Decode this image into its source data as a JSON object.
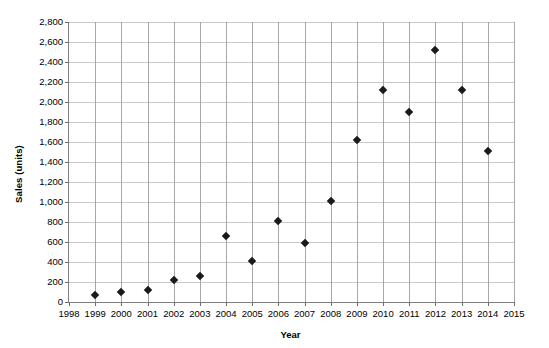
{
  "chart_data": {
    "type": "scatter",
    "title": "",
    "xlabel": "Year",
    "ylabel": "Sales (units)",
    "xlim": [
      1998,
      2015
    ],
    "ylim": [
      0,
      2800
    ],
    "ytick_step": 200,
    "xtick_step": 1,
    "grid": true,
    "legend": "none",
    "marker": "diamond",
    "marker_color": "#1a1a1a",
    "x": [
      1999,
      2000,
      2001,
      2002,
      2003,
      2004,
      2005,
      2006,
      2007,
      2008,
      2009,
      2010,
      2011,
      2012,
      2013,
      2014
    ],
    "values": [
      70,
      100,
      120,
      220,
      260,
      660,
      415,
      810,
      595,
      1010,
      1620,
      2120,
      1900,
      2520,
      2120,
      1510
    ],
    "points": [
      {
        "year": 1999,
        "sales": 70
      },
      {
        "year": 2000,
        "sales": 100
      },
      {
        "year": 2001,
        "sales": 120
      },
      {
        "year": 2002,
        "sales": 220
      },
      {
        "year": 2003,
        "sales": 260
      },
      {
        "year": 2004,
        "sales": 660
      },
      {
        "year": 2005,
        "sales": 415
      },
      {
        "year": 2006,
        "sales": 810
      },
      {
        "year": 2007,
        "sales": 595
      },
      {
        "year": 2008,
        "sales": 1010
      },
      {
        "year": 2009,
        "sales": 1620
      },
      {
        "year": 2010,
        "sales": 2120
      },
      {
        "year": 2011,
        "sales": 1900
      },
      {
        "year": 2012,
        "sales": 2520
      },
      {
        "year": 2013,
        "sales": 2120
      },
      {
        "year": 2014,
        "sales": 1510
      }
    ],
    "ytick_labels": [
      "0",
      "200",
      "400",
      "600",
      "800",
      "1,000",
      "1,200",
      "1,400",
      "1,600",
      "1,800",
      "2,000",
      "2,200",
      "2,400",
      "2,600",
      "2,800"
    ],
    "ytick_values": [
      0,
      200,
      400,
      600,
      800,
      1000,
      1200,
      1400,
      1600,
      1800,
      2000,
      2200,
      2400,
      2600,
      2800
    ],
    "xtick_labels": [
      "1998",
      "1999",
      "2000",
      "2001",
      "2002",
      "2003",
      "2004",
      "2005",
      "2006",
      "2007",
      "2008",
      "2009",
      "2010",
      "2011",
      "2012",
      "2013",
      "2014",
      "2015"
    ],
    "xtick_values": [
      1998,
      1999,
      2000,
      2001,
      2002,
      2003,
      2004,
      2005,
      2006,
      2007,
      2008,
      2009,
      2010,
      2011,
      2012,
      2013,
      2014,
      2015
    ],
    "colors": {
      "background": "#ffffff",
      "axis": "#808080",
      "gridline_horizontal": "#c9c9c9",
      "gridline_vertical": "#a8a8a8",
      "text": "#000000"
    }
  }
}
